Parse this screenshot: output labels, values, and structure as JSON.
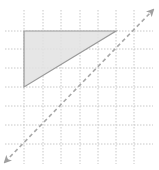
{
  "diagram": {
    "type": "coordinate-grid",
    "width": 159,
    "height": 170,
    "colors": {
      "background": "#ffffff",
      "grid": "#c8c8c8",
      "triangle_fill": "#e2e2e2",
      "triangle_stroke": "#9a9a9a",
      "line": "#a8a8a8"
    },
    "grid": {
      "vertical_x": [
        24,
        43,
        61,
        80,
        98,
        116,
        134
      ],
      "horizontal_y": [
        31,
        49,
        68,
        87,
        106,
        125,
        144
      ],
      "x_extent": [
        5,
        153
      ],
      "y_extent": [
        10,
        164
      ]
    },
    "triangle": {
      "points": [
        [
          24,
          31
        ],
        [
          116,
          31
        ],
        [
          24,
          87
        ]
      ],
      "grid_vertices": [
        [
          0,
          6
        ],
        [
          5,
          6
        ],
        [
          0,
          3
        ]
      ]
    },
    "line": {
      "style": "dashed",
      "arrows": "both",
      "from": [
        5,
        162
      ],
      "to": [
        153,
        10
      ]
    }
  }
}
